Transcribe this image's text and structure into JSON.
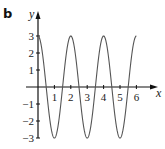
{
  "panel_label": "b",
  "colors": {
    "curve": "#555555",
    "axis": "#111111"
  },
  "chart_data": {
    "type": "line",
    "title": "",
    "xlabel": "x",
    "ylabel": "y",
    "function": "y = 3cos(πx)",
    "xlim": [
      0,
      6
    ],
    "ylim": [
      -3,
      3
    ],
    "x_ticks": [
      1,
      2,
      3,
      4,
      5,
      6
    ],
    "x_tick_labels": [
      "1",
      "2",
      "3",
      "4",
      "5",
      "6"
    ],
    "y_ticks": [
      3,
      2,
      1,
      -1,
      -2,
      -3
    ],
    "y_tick_labels": [
      "3",
      "2",
      "1",
      "−1",
      "−2",
      "−3"
    ],
    "grid": false,
    "legend": null,
    "series": [
      {
        "name": "curve",
        "x": [
          0,
          0.5,
          1,
          1.5,
          2,
          2.5,
          3,
          3.5,
          4,
          4.5,
          5,
          5.5,
          6
        ],
        "values": [
          3,
          0,
          -3,
          0,
          3,
          0,
          -3,
          0,
          3,
          0,
          -3,
          0,
          3
        ]
      }
    ]
  }
}
